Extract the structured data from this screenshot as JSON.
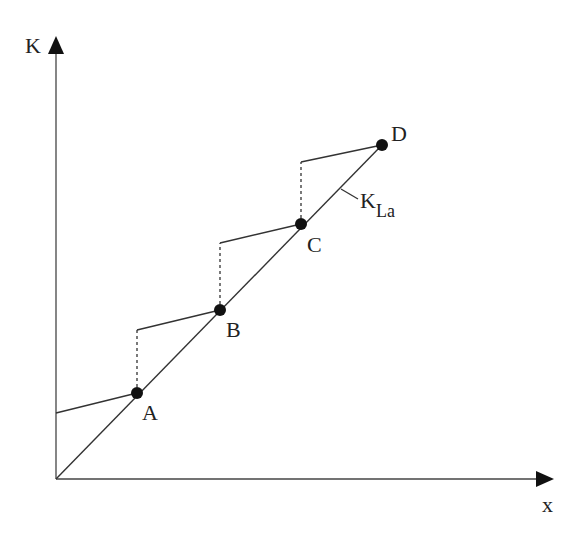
{
  "diagram": {
    "axes": {
      "y_label": "K",
      "x_label": "x"
    },
    "line_label": {
      "main": "K",
      "subscript": "La"
    },
    "points": [
      {
        "label": "A",
        "x": 137,
        "y": 393
      },
      {
        "label": "B",
        "x": 220,
        "y": 310
      },
      {
        "label": "C",
        "x": 301,
        "y": 224
      },
      {
        "label": "D",
        "x": 382,
        "y": 145
      }
    ],
    "colors": {
      "line": "#333333",
      "point": "#111111",
      "background": "#ffffff"
    }
  }
}
